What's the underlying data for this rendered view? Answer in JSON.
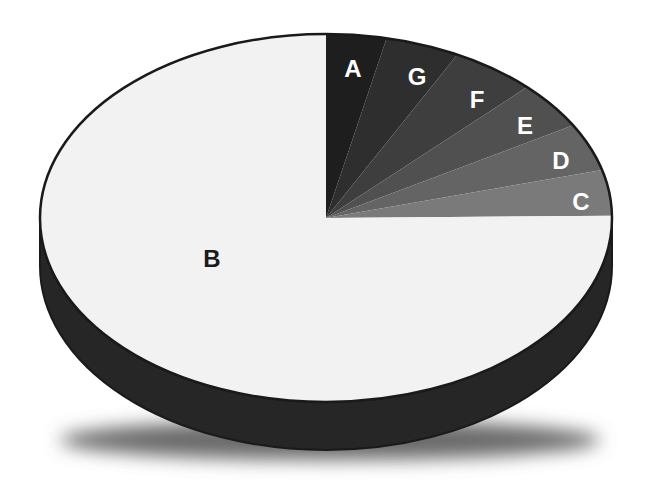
{
  "chart_data": {
    "type": "pie",
    "style": "3d",
    "title": "",
    "labels": [
      "A",
      "G",
      "F",
      "E",
      "D",
      "C",
      "B"
    ],
    "values": [
      3.4,
      4.2,
      4.8,
      4.2,
      4.2,
      4.0,
      75.2
    ],
    "colors": [
      "#1e1e1e",
      "#2e2e2e",
      "#3e3e3e",
      "#505050",
      "#646464",
      "#7a7a7a",
      "#f2f2f2"
    ],
    "label_colors": [
      "#ffffff",
      "#ffffff",
      "#ffffff",
      "#ffffff",
      "#ffffff",
      "#ffffff",
      "#1a1a1a"
    ],
    "start_angle_deg": 0,
    "direction": "clockwise-from-top",
    "legend": "none",
    "depth_color": "#262626",
    "outline_color": "#1a1a1a"
  },
  "labels": {
    "A": "A",
    "G": "G",
    "F": "F",
    "E": "E",
    "D": "D",
    "C": "C",
    "B": "B"
  }
}
